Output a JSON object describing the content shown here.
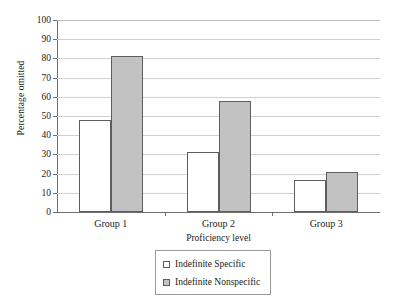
{
  "chart_data": {
    "type": "bar",
    "title": "",
    "xlabel": "Proficiency level",
    "ylabel": "Percentage omitted",
    "categories": [
      "Group 1",
      "Group 2",
      "Group 3"
    ],
    "series": [
      {
        "name": "Indefinite Specific",
        "values": [
          48,
          31,
          16.5
        ],
        "color": "#ffffff"
      },
      {
        "name": "Indefinite Nonspecific",
        "values": [
          81,
          58,
          21
        ],
        "color": "#c2c2c2"
      }
    ],
    "ylim": [
      0,
      100
    ],
    "yticks": [
      0,
      10,
      20,
      30,
      40,
      50,
      60,
      70,
      80,
      90,
      100
    ],
    "ytick_labels": [
      "0",
      "10",
      "20",
      "30",
      "40",
      "50",
      "60",
      "70",
      "80",
      "90",
      "100"
    ],
    "grid": true,
    "grid_axis": "y",
    "legend_position": "bottom-center",
    "legend_entries": [
      "Indefinite Specific",
      "Indefinite Nonspecific"
    ],
    "axis_color": "#6e6e6e",
    "grid_color": "#d0d0d0",
    "bar_edge_color": "#5d5d5d"
  }
}
